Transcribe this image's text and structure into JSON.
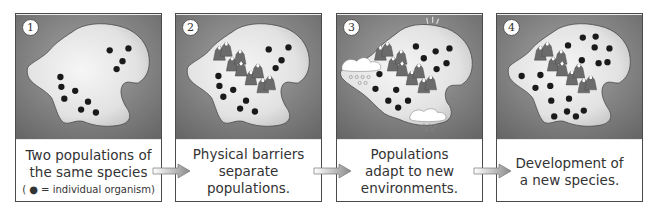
{
  "diagram": {
    "colors": {
      "panel_bg_dark": "#6e6e6e",
      "panel_bg_light": "#9a9a9a",
      "island_fill": "#e8e8e8",
      "organism_dot": "#1a1a1a",
      "mountain": "#6a6a6a",
      "border": "#4a4a4a",
      "text": "#333333"
    },
    "panels": [
      {
        "number": "1",
        "caption_lines": [
          "Two populations of",
          "the same species"
        ],
        "legend": "( ● = individual organism)",
        "has_mountains": false,
        "has_clouds": false,
        "organisms": [
          [
            95,
            36
          ],
          [
            114,
            34
          ],
          [
            108,
            47
          ],
          [
            102,
            55
          ],
          [
            45,
            63
          ],
          [
            46,
            73
          ],
          [
            60,
            77
          ],
          [
            49,
            85
          ],
          [
            73,
            88
          ],
          [
            66,
            96
          ],
          [
            81,
            99
          ]
        ]
      },
      {
        "number": "2",
        "caption_lines": [
          "Physical barriers",
          "separate",
          "populations."
        ],
        "has_mountains": true,
        "has_clouds": false,
        "organisms": [
          [
            94,
            35
          ],
          [
            114,
            33
          ],
          [
            107,
            46
          ],
          [
            101,
            54
          ],
          [
            43,
            62
          ],
          [
            44,
            72
          ],
          [
            58,
            76
          ],
          [
            48,
            83
          ],
          [
            71,
            87
          ],
          [
            65,
            95
          ],
          [
            80,
            98
          ]
        ]
      },
      {
        "number": "3",
        "caption_lines": [
          "Populations",
          "adapt to new",
          "environments."
        ],
        "has_mountains": true,
        "has_clouds": true,
        "organisms": [
          [
            80,
            32
          ],
          [
            100,
            37
          ],
          [
            114,
            34
          ],
          [
            88,
            44
          ],
          [
            111,
            49
          ],
          [
            101,
            55
          ],
          [
            43,
            60
          ],
          [
            39,
            75
          ],
          [
            60,
            76
          ],
          [
            52,
            87
          ],
          [
            72,
            87
          ],
          [
            62,
            94
          ]
        ]
      },
      {
        "number": "4",
        "caption_lines": [
          "Development of",
          "a new species."
        ],
        "has_mountains": true,
        "has_clouds": false,
        "organisms": [
          [
            87,
            23
          ],
          [
            100,
            22
          ],
          [
            72,
            31
          ],
          [
            99,
            33
          ],
          [
            114,
            34
          ],
          [
            86,
            46
          ],
          [
            112,
            48
          ],
          [
            103,
            49
          ],
          [
            25,
            62
          ],
          [
            44,
            61
          ],
          [
            39,
            74
          ],
          [
            54,
            72
          ],
          [
            55,
            87
          ],
          [
            73,
            85
          ],
          [
            71,
            98
          ],
          [
            88,
            97
          ],
          [
            58,
            103
          ],
          [
            80,
            103
          ]
        ]
      }
    ],
    "arrows": [
      {
        "from": "1",
        "to": "2"
      },
      {
        "from": "2",
        "to": "3"
      },
      {
        "from": "3",
        "to": "4"
      }
    ]
  }
}
